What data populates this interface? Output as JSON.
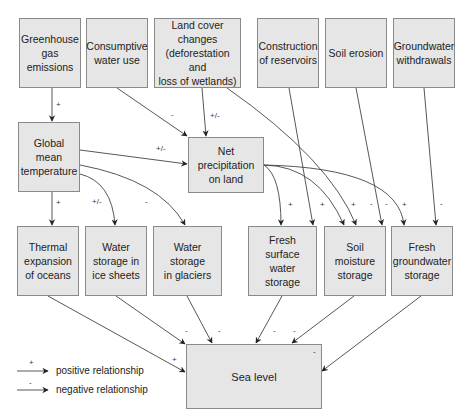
{
  "diagram": {
    "nodes": {
      "greenhouse": "Greenhouse\ngas\nemissions",
      "consumptive": "Consumptive\nwater use",
      "landcover": "Land cover changes\n(deforestation and\nloss of wetlands)",
      "reservoirs": "Construction\nof reservoirs",
      "erosion": "Soil erosion",
      "gw_withdrawals": "Groundwater\nwithdrawals",
      "temperature": "Global\nmean\ntemperature",
      "net_precip": "Net precipitation\non land",
      "thermal": "Thermal\nexpansion\nof oceans",
      "ice_sheets": "Water\nstorage in\nice sheets",
      "glaciers": "Water storage\nin glaciers",
      "surface": "Fresh surface\nwater storage",
      "soil_moisture": "Soil moisture\nstorage",
      "fresh_gw": "Fresh\ngroundwater\nstorage",
      "sea_level": "Sea level"
    },
    "edges": [
      {
        "from": "greenhouse",
        "to": "temperature",
        "sign": "+"
      },
      {
        "from": "consumptive",
        "to": "net_precip",
        "sign": "-"
      },
      {
        "from": "landcover",
        "to": "net_precip",
        "sign": "+/-"
      },
      {
        "from": "temperature",
        "to": "net_precip",
        "sign": "+/-"
      },
      {
        "from": "temperature",
        "to": "thermal",
        "sign": "+"
      },
      {
        "from": "temperature",
        "to": "ice_sheets",
        "sign": "+/-"
      },
      {
        "from": "temperature",
        "to": "glaciers",
        "sign": "-"
      },
      {
        "from": "net_precip",
        "to": "surface",
        "sign": "+"
      },
      {
        "from": "reservoirs",
        "to": "surface",
        "sign": "+"
      },
      {
        "from": "landcover",
        "to": "soil_moisture",
        "sign": "+"
      },
      {
        "from": "net_precip",
        "to": "soil_moisture",
        "sign": "-"
      },
      {
        "from": "erosion",
        "to": "soil_moisture",
        "sign": "-"
      },
      {
        "from": "net_precip",
        "to": "fresh_gw",
        "sign": "+"
      },
      {
        "from": "gw_withdrawals",
        "to": "fresh_gw",
        "sign": "-"
      },
      {
        "from": "thermal",
        "to": "sea_level",
        "sign": "+"
      },
      {
        "from": "ice_sheets",
        "to": "sea_level",
        "sign": "-"
      },
      {
        "from": "glaciers",
        "to": "sea_level",
        "sign": "-"
      },
      {
        "from": "surface",
        "to": "sea_level",
        "sign": "-"
      },
      {
        "from": "soil_moisture",
        "to": "sea_level",
        "sign": "-"
      },
      {
        "from": "fresh_gw",
        "to": "sea_level",
        "sign": "-"
      }
    ]
  },
  "signs": {
    "s1": "+",
    "s2": "-",
    "s3": "+/-",
    "s4": "+/-",
    "s5": "+",
    "s6": "+/-",
    "s7": "-",
    "s8": "+",
    "s9": "+",
    "s10": "+",
    "s11": "-",
    "s12": "-",
    "s13": "+",
    "s14": "-",
    "s15": "+",
    "s16": "-",
    "s17": "-",
    "s18": "-",
    "s19": "-",
    "s20": "-"
  },
  "legend": {
    "positive": {
      "sign": "+",
      "label": "positive relationship"
    },
    "negative": {
      "sign": "-",
      "label": "negative relationship"
    }
  }
}
